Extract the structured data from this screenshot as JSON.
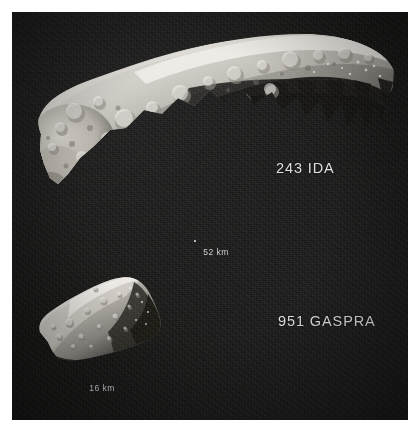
{
  "figure": {
    "kind": "asteroid-comparison-photograph",
    "background_color": "#141413",
    "border_color": "#ffffff",
    "text_color": "#dedede"
  },
  "objects": [
    {
      "id": "ida",
      "label": "243 IDA",
      "scale_label": "52 km",
      "scale_value": 52,
      "scale_unit": "km"
    },
    {
      "id": "gaspra",
      "label": "951 GASPRA",
      "scale_label": "16 km",
      "scale_value": 16,
      "scale_unit": "km"
    }
  ],
  "labels": {
    "ida": "243 IDA",
    "gaspra": "951 GASPRA"
  },
  "scales": {
    "ida": "52 km",
    "gaspra": "16 km"
  }
}
